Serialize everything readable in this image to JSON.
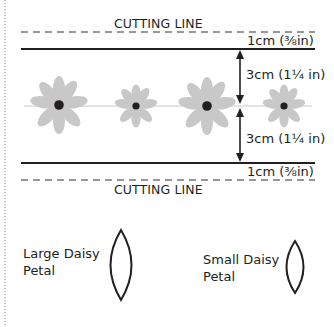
{
  "cutting_lines": {
    "top_label": "CUTTING LINE",
    "bottom_label": "CUTTING LINE"
  },
  "measurements": {
    "top_margin": "1cm (⅜in)",
    "upper_half": "3cm (1¼ in)",
    "lower_half": "3cm (1¼ in)",
    "bottom_margin": "1cm (⅜in)"
  },
  "flowers": [
    {
      "type": "large",
      "cx": 59,
      "cy": 105
    },
    {
      "type": "small",
      "cx": 136,
      "cy": 106
    },
    {
      "type": "large",
      "cx": 207,
      "cy": 106
    },
    {
      "type": "small",
      "cx": 284,
      "cy": 106
    }
  ],
  "petals": {
    "large_label_line1": "Large Daisy",
    "large_label_line2": "Petal",
    "small_label_line1": "Small Daisy",
    "small_label_line2": "Petal"
  },
  "colors": {
    "ink": "#231f20",
    "petal_fill": "#c8c8c8",
    "center_fill": "#231f20",
    "dashed": "#777777"
  }
}
